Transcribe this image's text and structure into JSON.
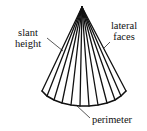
{
  "diagram": {
    "labels": {
      "slant_height_line1": "slant",
      "slant_height_line2": "height",
      "lateral_faces_line1": "lateral",
      "lateral_faces_line2": "faces",
      "perimeter": "perimeter"
    },
    "colors": {
      "stroke": "#111111",
      "background": "#ffffff"
    }
  }
}
